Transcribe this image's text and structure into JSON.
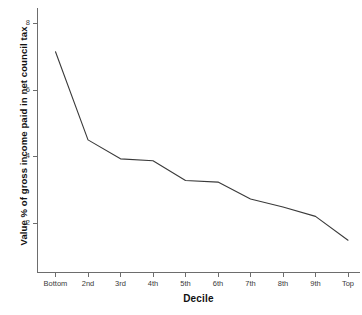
{
  "chart_data": {
    "type": "line",
    "title": "",
    "xlabel": "Decile",
    "ylabel": "Value % of gross income paid in net council tax",
    "categories": [
      "Bottom",
      "2nd",
      "3rd",
      "4th",
      "5th",
      "6th",
      "7th",
      "8th",
      "9th",
      "Top"
    ],
    "values": [
      7.15,
      4.5,
      3.93,
      3.87,
      3.28,
      3.23,
      2.72,
      2.48,
      2.2,
      1.48
    ],
    "series": [
      {
        "name": "Net council tax as % of gross income",
        "values": [
          7.15,
          4.5,
          3.93,
          3.87,
          3.28,
          3.23,
          2.72,
          2.48,
          2.2,
          1.48
        ]
      }
    ],
    "ylim": [
      0.8,
      8.4
    ],
    "ytick_labels": [
      "2",
      "4",
      "6",
      "8"
    ],
    "ytick_values": [
      2,
      4,
      6,
      8
    ],
    "xtick_labels": [
      "Bottom",
      "2nd",
      "3rd",
      "4th",
      "5th",
      "6th",
      "7th",
      "8th",
      "9th",
      "Top"
    ],
    "grid": false,
    "legend": "none",
    "line_color": "#3a3a3a",
    "axis_color": "#6d6d6d",
    "background_color": "#ffffff"
  },
  "axes": {
    "y_title": "Value % of gross income paid in net council tax",
    "x_title": "Decile"
  },
  "y_ticks": [
    {
      "label": "8",
      "value": 8
    },
    {
      "label": "6",
      "value": 6
    },
    {
      "label": "4",
      "value": 4
    },
    {
      "label": "2",
      "value": 2
    }
  ],
  "x_ticks": [
    {
      "label": "Bottom"
    },
    {
      "label": "2nd"
    },
    {
      "label": "3rd"
    },
    {
      "label": "4th"
    },
    {
      "label": "5th"
    },
    {
      "label": "6th"
    },
    {
      "label": "7th"
    },
    {
      "label": "8th"
    },
    {
      "label": "9th"
    },
    {
      "label": "Top"
    }
  ]
}
